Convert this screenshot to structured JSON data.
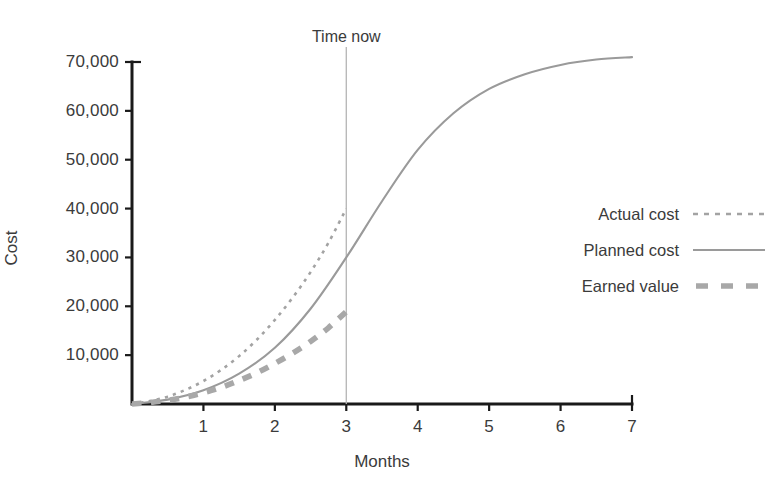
{
  "chart_data": {
    "type": "line",
    "title": "",
    "xlabel": "Months",
    "ylabel": "Cost",
    "xlim": [
      0,
      7
    ],
    "ylim": [
      0,
      73000
    ],
    "grid": false,
    "legend_position": "right",
    "x_ticks": [
      "1",
      "2",
      "3",
      "4",
      "5",
      "6",
      "7"
    ],
    "x_tick_values": [
      1,
      2,
      3,
      4,
      5,
      6,
      7
    ],
    "y_ticks": [
      "10,000",
      "20,000",
      "30,000",
      "40,000",
      "50,000",
      "60,000",
      "70,000"
    ],
    "y_tick_values": [
      10000,
      20000,
      30000,
      40000,
      50000,
      60000,
      70000
    ],
    "annotations": [
      {
        "name": "time-now",
        "label": "Time now",
        "x": 3,
        "style": "vertical-line"
      }
    ],
    "series": [
      {
        "name": "Actual cost",
        "style": "dotted",
        "color": "#a3a3a3",
        "x": [
          0,
          0.25,
          0.5,
          0.75,
          1,
          1.25,
          1.5,
          1.75,
          2,
          2.25,
          2.5,
          2.75,
          3
        ],
        "values": [
          0,
          600,
          1500,
          2900,
          4700,
          7000,
          9800,
          13200,
          17200,
          21800,
          27000,
          33000,
          40000
        ]
      },
      {
        "name": "Planned cost",
        "style": "solid",
        "color": "#9a9a9a",
        "x": [
          0,
          0.5,
          1,
          1.5,
          2,
          2.5,
          3,
          3.5,
          4,
          4.5,
          5,
          5.5,
          6,
          6.5,
          7
        ],
        "values": [
          0,
          900,
          2800,
          6200,
          11500,
          19500,
          30000,
          41500,
          52000,
          59500,
          64500,
          67500,
          69400,
          70500,
          71000
        ]
      },
      {
        "name": "Earned value",
        "style": "thick-dashed",
        "color": "#a8a8a8",
        "x": [
          0,
          0.25,
          0.5,
          0.75,
          1,
          1.25,
          1.5,
          1.75,
          2,
          2.25,
          2.5,
          2.75,
          3
        ],
        "values": [
          0,
          300,
          750,
          1400,
          2300,
          3400,
          4800,
          6400,
          8300,
          10400,
          12800,
          15600,
          18900
        ]
      }
    ]
  },
  "axes": {
    "y_title": "Cost",
    "x_title": "Months"
  },
  "legend": {
    "items": [
      {
        "label": "Actual cost",
        "swatch": "dotted-line-icon"
      },
      {
        "label": "Planned cost",
        "swatch": "solid-line-icon"
      },
      {
        "label": "Earned value",
        "swatch": "dashed-line-icon"
      }
    ]
  },
  "colors": {
    "axis": "#1a1a1a",
    "text": "#3b3b3b",
    "planned": "#9a9a9a",
    "actual": "#a3a3a3",
    "earned": "#a8a8a8",
    "nowline": "#b4b4b4",
    "background": "#ffffff"
  }
}
